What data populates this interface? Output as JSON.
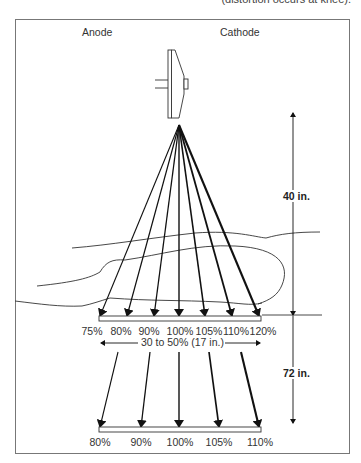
{
  "caption_top": "(distortion occurs at knee).",
  "labels": {
    "anode": "Anode",
    "cathode": "Cathode",
    "distance_40": "40 in.",
    "distance_72": "72 in.",
    "field_width": "30 to 50% (17 in.)"
  },
  "level_40in": {
    "percentages": [
      "75%",
      "80%",
      "90%",
      "100%",
      "105%",
      "110%",
      "120%"
    ]
  },
  "level_72in": {
    "percentages": [
      "80%",
      "90%",
      "100%",
      "105%",
      "110%"
    ]
  },
  "colors": {
    "line": "#111111",
    "frame": "#777777",
    "text": "#333333"
  }
}
